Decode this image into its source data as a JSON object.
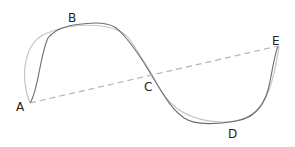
{
  "diagram": {
    "labels": {
      "a": "A",
      "b": "B",
      "c": "C",
      "d": "D",
      "e": "E"
    },
    "colors": {
      "dark_curve": "#6e6e6e",
      "light_curve": "#c4c4c4",
      "dashed_line": "#b4b4b4",
      "label": "#222222"
    }
  }
}
